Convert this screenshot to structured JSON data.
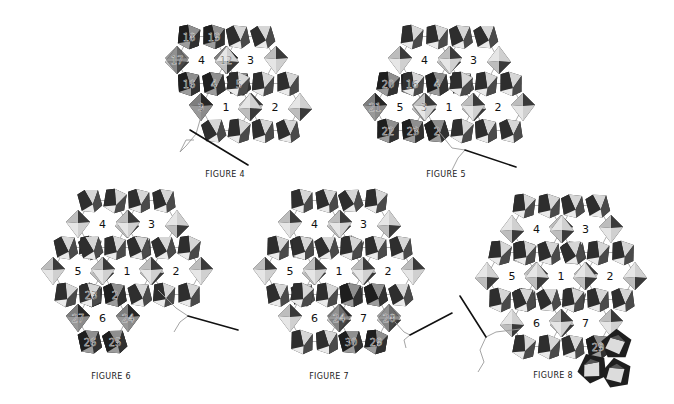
{
  "colors": {
    "bead_dark": "#1e1e1e",
    "bead_mid": "#5a5a5a",
    "bead_light": "#d6d6d6",
    "bead_highlight": "#f2f2f2",
    "thread": "#9a9a9a",
    "needle": "#111111",
    "label": "#111111"
  },
  "geometry": {
    "col_spacing": 49,
    "row_spacing": 47
  },
  "figures": [
    {
      "id": "fig4",
      "caption": "FIGURE 4",
      "caption_pos": [
        225,
        178
      ],
      "origin": [
        226,
        107
      ],
      "cells": [
        {
          "label": "1",
          "col": 0,
          "row": 0
        },
        {
          "label": "2",
          "col": 1,
          "row": 0
        },
        {
          "label": "3",
          "col": 0.5,
          "row": -1
        },
        {
          "label": "4",
          "col": -0.5,
          "row": -1
        }
      ],
      "highlighted": [
        {
          "n": "3",
          "slot": "L",
          "cell": 0
        },
        {
          "n": "4",
          "slot": "TL",
          "cell": 0
        },
        {
          "n": "5",
          "slot": "TR",
          "cell": 0
        },
        {
          "n": "12",
          "slot": "L",
          "cell": 2
        },
        {
          "n": "16",
          "slot": "BL",
          "cell": 3
        },
        {
          "n": "17",
          "slot": "L",
          "cell": 3
        },
        {
          "n": "18",
          "slot": "TL",
          "cell": 3
        },
        {
          "n": "19",
          "slot": "TR",
          "cell": 3
        }
      ],
      "needle": {
        "from": [
          190,
          130
        ],
        "to": [
          248,
          165
        ],
        "thread": [
          [
            200,
            120
          ],
          [
            196,
            134
          ],
          [
            186,
            146
          ],
          [
            180,
            152
          ],
          [
            186,
            140
          ],
          [
            194,
            140
          ]
        ]
      }
    },
    {
      "id": "fig5",
      "caption": "FIGURE 5",
      "caption_pos": [
        446,
        178
      ],
      "origin": [
        449,
        107
      ],
      "cells": [
        {
          "label": "1",
          "col": 0,
          "row": 0
        },
        {
          "label": "2",
          "col": 1,
          "row": 0
        },
        {
          "label": "3",
          "col": 0.5,
          "row": -1
        },
        {
          "label": "4",
          "col": -0.5,
          "row": -1
        },
        {
          "label": "5",
          "col": -1,
          "row": 0
        }
      ],
      "highlighted": [
        {
          "n": "16",
          "slot": "BL",
          "cell": 3
        },
        {
          "n": "4",
          "slot": "TL",
          "cell": 0
        },
        {
          "n": "3",
          "slot": "L",
          "cell": 0
        },
        {
          "n": "20",
          "slot": "TL",
          "cell": 4
        },
        {
          "n": "21",
          "slot": "L",
          "cell": 4
        },
        {
          "n": "22",
          "slot": "BL",
          "cell": 4
        },
        {
          "n": "23",
          "slot": "BR",
          "cell": 4
        },
        {
          "n": "2",
          "slot": "BL",
          "cell": 0
        }
      ],
      "needle": {
        "from": [
          465,
          150
        ],
        "to": [
          516,
          167
        ],
        "thread": [
          [
            440,
            133
          ],
          [
            452,
            148
          ],
          [
            465,
            150
          ],
          [
            458,
            158
          ],
          [
            452,
            170
          ]
        ]
      }
    },
    {
      "id": "fig6",
      "caption": "FIGURE 6",
      "caption_pos": [
        111,
        380
      ],
      "origin": [
        127,
        271
      ],
      "cells": [
        {
          "label": "1",
          "col": 0,
          "row": 0
        },
        {
          "label": "2",
          "col": 1,
          "row": 0
        },
        {
          "label": "3",
          "col": 0.5,
          "row": -1
        },
        {
          "label": "4",
          "col": -0.5,
          "row": -1
        },
        {
          "label": "5",
          "col": -1,
          "row": 0
        },
        {
          "label": "6",
          "col": -0.5,
          "row": 1
        }
      ],
      "highlighted": [
        {
          "n": "23",
          "slot": "BR",
          "cell": 4
        },
        {
          "n": "2",
          "slot": "BL",
          "cell": 0
        },
        {
          "n": "24",
          "slot": "R",
          "cell": 5
        },
        {
          "n": "25",
          "slot": "BR",
          "cell": 5
        },
        {
          "n": "26",
          "slot": "BL",
          "cell": 5
        },
        {
          "n": "27",
          "slot": "L",
          "cell": 5
        }
      ],
      "needle": {
        "from": [
          188,
          316
        ],
        "to": [
          238,
          330
        ],
        "thread": [
          [
            158,
            290
          ],
          [
            176,
            308
          ],
          [
            188,
            316
          ],
          [
            180,
            322
          ],
          [
            174,
            332
          ]
        ]
      }
    },
    {
      "id": "fig7",
      "caption": "FIGURE 7",
      "caption_pos": [
        329,
        380
      ],
      "origin": [
        339,
        271
      ],
      "cells": [
        {
          "label": "1",
          "col": 0,
          "row": 0
        },
        {
          "label": "2",
          "col": 1,
          "row": 0
        },
        {
          "label": "3",
          "col": 0.5,
          "row": -1
        },
        {
          "label": "4",
          "col": -0.5,
          "row": -1
        },
        {
          "label": "5",
          "col": -1,
          "row": 0
        },
        {
          "label": "6",
          "col": -0.5,
          "row": 1
        },
        {
          "label": "7",
          "col": 0.5,
          "row": 1
        }
      ],
      "highlighted": [
        {
          "n": "24",
          "slot": "L",
          "cell": 6
        },
        {
          "n": "28",
          "slot": "R",
          "cell": 6
        },
        {
          "n": "29",
          "slot": "BR",
          "cell": 6
        },
        {
          "n": "30",
          "slot": "BL",
          "cell": 6
        },
        {
          "n": "",
          "slot": "TL",
          "cell": 6
        },
        {
          "n": "",
          "slot": "TR",
          "cell": 6
        }
      ],
      "needle": {
        "from": [
          410,
          335
        ],
        "to": [
          452,
          313
        ],
        "thread": [
          [
            395,
            322
          ],
          [
            404,
            332
          ],
          [
            410,
            335
          ],
          [
            404,
            340
          ],
          [
            406,
            348
          ]
        ]
      }
    },
    {
      "id": "fig8",
      "caption": "FIGURE 8",
      "caption_pos": [
        553,
        379
      ],
      "origin": [
        561,
        276
      ],
      "cells": [
        {
          "label": "1",
          "col": 0,
          "row": 0
        },
        {
          "label": "2",
          "col": 1,
          "row": 0
        },
        {
          "label": "3",
          "col": 0.5,
          "row": -1
        },
        {
          "label": "4",
          "col": -0.5,
          "row": -1
        },
        {
          "label": "5",
          "col": -1,
          "row": 0
        },
        {
          "label": "6",
          "col": -0.5,
          "row": 1
        },
        {
          "label": "7",
          "col": 0.5,
          "row": 1
        }
      ],
      "highlighted": [
        {
          "n": "29",
          "slot": "BR",
          "cell": 6
        }
      ],
      "extra_beads": [
        {
          "x": 616,
          "y": 344,
          "shape": "pent",
          "rot": 15
        },
        {
          "x": 592,
          "y": 368,
          "shape": "pent",
          "rot": -10
        },
        {
          "x": 616,
          "y": 373,
          "shape": "pent",
          "rot": 5
        }
      ],
      "needle": {
        "from": [
          460,
          296
        ],
        "to": [
          486,
          337
        ],
        "thread": [
          [
            520,
            329
          ],
          [
            496,
            332
          ],
          [
            486,
            337
          ],
          [
            480,
            350
          ],
          [
            484,
            362
          ],
          [
            478,
            372
          ]
        ]
      }
    }
  ]
}
